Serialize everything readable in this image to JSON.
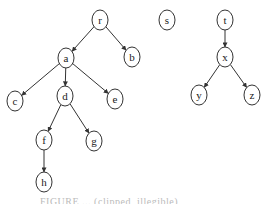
{
  "diagram": {
    "type": "directed-forest",
    "node_radius_x": 8,
    "node_radius_y": 10,
    "colors": {
      "stroke": "#333333",
      "fill": "#ffffff",
      "text": "#222222"
    },
    "nodes": [
      {
        "id": "r",
        "label": "r",
        "x": 100,
        "y": 20
      },
      {
        "id": "a",
        "label": "a",
        "x": 66,
        "y": 58
      },
      {
        "id": "b",
        "label": "b",
        "x": 132,
        "y": 57
      },
      {
        "id": "c",
        "label": "c",
        "x": 15,
        "y": 101
      },
      {
        "id": "d",
        "label": "d",
        "x": 65,
        "y": 96
      },
      {
        "id": "e",
        "label": "e",
        "x": 115,
        "y": 99
      },
      {
        "id": "f",
        "label": "f",
        "x": 44,
        "y": 140
      },
      {
        "id": "g",
        "label": "g",
        "x": 94,
        "y": 141
      },
      {
        "id": "h",
        "label": "h",
        "x": 44,
        "y": 182
      },
      {
        "id": "s",
        "label": "s",
        "x": 167,
        "y": 20
      },
      {
        "id": "t",
        "label": "t",
        "x": 225,
        "y": 20
      },
      {
        "id": "x",
        "label": "x",
        "x": 225,
        "y": 57
      },
      {
        "id": "y",
        "label": "y",
        "x": 199,
        "y": 95
      },
      {
        "id": "z",
        "label": "z",
        "x": 252,
        "y": 95
      }
    ],
    "edges": [
      {
        "from": "r",
        "to": "a"
      },
      {
        "from": "r",
        "to": "b"
      },
      {
        "from": "a",
        "to": "c"
      },
      {
        "from": "a",
        "to": "d"
      },
      {
        "from": "a",
        "to": "e"
      },
      {
        "from": "d",
        "to": "f"
      },
      {
        "from": "d",
        "to": "g"
      },
      {
        "from": "f",
        "to": "h"
      },
      {
        "from": "t",
        "to": "x"
      },
      {
        "from": "x",
        "to": "y"
      },
      {
        "from": "x",
        "to": "z"
      }
    ]
  },
  "caption": {
    "text": "FIGURE  ...  (clipped, illegible)"
  }
}
